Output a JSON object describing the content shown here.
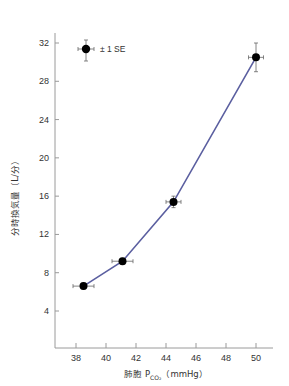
{
  "chart_data": {
    "type": "line",
    "title": "",
    "xlabel": "肺胞 P_CO2（mmHg）",
    "xlabel_parts": {
      "prefix": "肺胞 P",
      "subscript": "CO₂",
      "suffix": "（mmHg）"
    },
    "ylabel": "分時換気量（L/分）",
    "xlim": [
      36.7,
      51.2
    ],
    "ylim": [
      0,
      33.5
    ],
    "x_ticks": [
      38,
      40,
      42,
      44,
      46,
      48,
      50
    ],
    "y_ticks": [
      4,
      8,
      12,
      16,
      20,
      24,
      28,
      32
    ],
    "grid": false,
    "legend": {
      "label": "± 1 SE",
      "position": "upper-left"
    },
    "series": [
      {
        "name": "分時換気量",
        "color": "#5b5fa0",
        "marker": "filled-circle",
        "points": [
          {
            "x": 38.5,
            "y": 6.6,
            "x_err": 0.7,
            "y_err": 0.3
          },
          {
            "x": 41.1,
            "y": 9.2,
            "x_err": 0.7,
            "y_err": 0.3
          },
          {
            "x": 44.5,
            "y": 15.4,
            "x_err": 0.5,
            "y_err": 0.6
          },
          {
            "x": 50.0,
            "y": 30.5,
            "x_err": 0.5,
            "y_err": 1.5
          }
        ]
      }
    ]
  },
  "legend": {
    "label": "± 1 SE"
  },
  "axes": {
    "x_title_prefix": "肺胞 P",
    "x_title_sub": "CO₂",
    "x_title_suffix": "（mmHg）",
    "y_title": "分時換気量（L/分）"
  }
}
